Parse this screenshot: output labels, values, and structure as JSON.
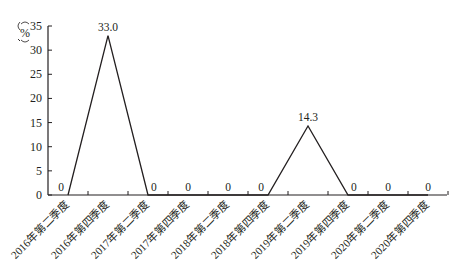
{
  "chart_data": {
    "type": "line",
    "title": "",
    "xlabel": "",
    "ylabel": "%",
    "ylim": [
      0,
      35
    ],
    "yticks": [
      0,
      5,
      10,
      15,
      20,
      25,
      30,
      35
    ],
    "grid": false,
    "legend": null,
    "categories": [
      "2016年第二季度",
      "2016年第四季度",
      "2017年第二季度",
      "2017年第四季度",
      "2018年第二季度",
      "2018年第四季度",
      "2019年第二季度",
      "2019年第四季度",
      "2020年第二季度",
      "2020年第四季度"
    ],
    "series": [
      {
        "name": "",
        "values": [
          0,
          33.0,
          0,
          0,
          0,
          0,
          14.3,
          0,
          0,
          0
        ],
        "labels": [
          "0",
          "33.0",
          "0",
          "0",
          "0",
          "0",
          "14.3",
          "0",
          "0",
          "0"
        ]
      }
    ]
  },
  "colors": {
    "line": "#231f20",
    "axis": "#231f20",
    "text": "#231f20",
    "background": "#ffffff"
  }
}
